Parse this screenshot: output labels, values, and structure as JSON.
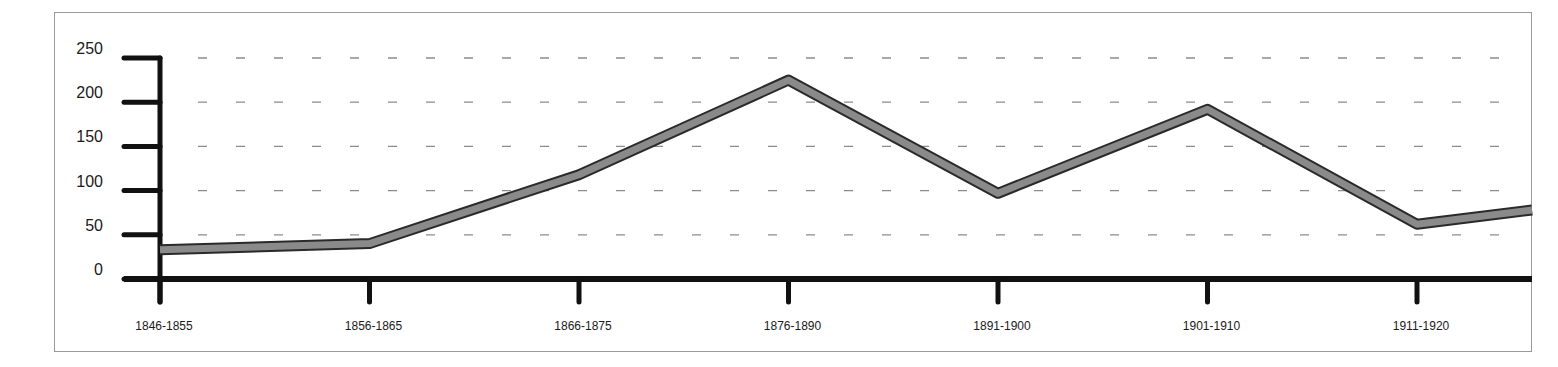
{
  "chart_data": {
    "type": "line",
    "title": "",
    "xlabel": "",
    "ylabel": "",
    "categories": [
      "1846-1855",
      "1856-1865",
      "1866-1875",
      "1876-1890",
      "1891-1900",
      "1901-1910",
      "1911-1920"
    ],
    "series": [
      {
        "name": "",
        "values": [
          33,
          40,
          118,
          225,
          97,
          192,
          62
        ],
        "trailing_value": 78
      }
    ],
    "yticks": [
      0,
      50,
      100,
      150,
      200,
      250
    ],
    "ylim": [
      0,
      250
    ],
    "grid": {
      "horizontal": true,
      "style": "dashed"
    },
    "legend": null
  },
  "colors": {
    "axis": "#111111",
    "line_fill": "#8a8a8a",
    "line_edge": "#2a2a2a",
    "grid": "#8c8c8c",
    "frame": "#9a9a9a",
    "text": "#1a1a1a"
  }
}
